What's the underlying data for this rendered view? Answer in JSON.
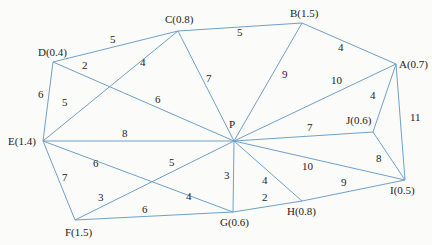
{
  "nodes": {
    "A": {
      "label": "A(0.7)",
      "x": 396,
      "y": 64,
      "lx": 399,
      "ly": 68
    },
    "B": {
      "label": "B(1.5)",
      "x": 302,
      "y": 23,
      "lx": 290,
      "ly": 17
    },
    "C": {
      "label": "C(0.8)",
      "x": 178,
      "y": 31,
      "lx": 165,
      "ly": 23
    },
    "D": {
      "label": "D(0.4)",
      "x": 53,
      "y": 62,
      "lx": 38,
      "ly": 56
    },
    "E": {
      "label": "E(1.4)",
      "x": 43,
      "y": 141,
      "lx": 8,
      "ly": 145
    },
    "F": {
      "label": "F(1.5)",
      "x": 75,
      "y": 220,
      "lx": 65,
      "ly": 236
    },
    "G": {
      "label": "G(0.6)",
      "x": 233,
      "y": 212,
      "lx": 220,
      "ly": 226
    },
    "H": {
      "label": "H(0.8)",
      "x": 302,
      "y": 201,
      "lx": 287,
      "ly": 215
    },
    "I": {
      "label": "I(0.5)",
      "x": 405,
      "y": 180,
      "lx": 390,
      "ly": 194
    },
    "J": {
      "label": "J(0.6)",
      "x": 373,
      "y": 132,
      "lx": 346,
      "ly": 124
    },
    "P": {
      "label": "P",
      "x": 234,
      "y": 141,
      "lx": 229,
      "ly": 128
    }
  },
  "edges": [
    {
      "from": "D",
      "to": "C",
      "weight": "5",
      "lx": 110,
      "ly": 43
    },
    {
      "from": "C",
      "to": "B",
      "weight": "5",
      "lx": 237,
      "ly": 36
    },
    {
      "from": "B",
      "to": "A",
      "weight": "4",
      "lx": 338,
      "ly": 51
    },
    {
      "from": "D",
      "to": "E",
      "weight": "6",
      "lx": 38,
      "ly": 98
    },
    {
      "from": "C",
      "to": "P",
      "weight": "7",
      "lx": 206,
      "ly": 82
    },
    {
      "from": "B",
      "to": "P",
      "weight": "9",
      "lx": 282,
      "ly": 78
    },
    {
      "from": "A",
      "to": "P",
      "weight": "10",
      "lx": 331,
      "ly": 84
    },
    {
      "from": "A",
      "to": "J",
      "weight": "4",
      "lx": 370,
      "ly": 99
    },
    {
      "from": "A",
      "to": "I",
      "weight": "11",
      "lx": 410,
      "ly": 121
    },
    {
      "from": "J",
      "to": "P",
      "weight": "7",
      "lx": 307,
      "ly": 131
    },
    {
      "from": "J",
      "to": "I",
      "weight": "8",
      "lx": 376,
      "ly": 162
    },
    {
      "from": "E",
      "to": "P",
      "weight": "8",
      "lx": 122,
      "ly": 137
    },
    {
      "from": "P",
      "to": "I",
      "weight": "10",
      "lx": 302,
      "ly": 170
    },
    {
      "from": "P",
      "to": "H",
      "weight": "4",
      "lx": 262,
      "ly": 184
    },
    {
      "from": "P",
      "to": "G",
      "weight": "3",
      "lx": 224,
      "ly": 179
    },
    {
      "from": "G",
      "to": "H",
      "weight": "2",
      "lx": 262,
      "ly": 201
    },
    {
      "from": "H",
      "to": "I",
      "weight": "9",
      "lx": 341,
      "ly": 186
    },
    {
      "from": "E",
      "to": "F",
      "weight": "7",
      "lx": 62,
      "ly": 181
    },
    {
      "from": "F",
      "to": "G",
      "weight": "6",
      "lx": 142,
      "ly": 213
    }
  ],
  "crossing_edges": [
    {
      "from": "C",
      "to": "E",
      "via": [
        97,
        81
      ],
      "weights": [
        {
          "w": "4",
          "lx": 140,
          "ly": 66
        },
        {
          "w": "5",
          "lx": 62,
          "ly": 106
        }
      ]
    },
    {
      "from": "D",
      "to": "P",
      "via": [
        97,
        81
      ],
      "weights": [
        {
          "w": "2",
          "lx": 82,
          "ly": 69
        },
        {
          "w": "6",
          "lx": 155,
          "ly": 103
        }
      ]
    },
    {
      "from": "E",
      "to": "G",
      "via": [
        133,
        190
      ],
      "weights": [
        {
          "w": "6",
          "lx": 93,
          "ly": 167
        },
        {
          "w": "4",
          "lx": 186,
          "ly": 200
        }
      ]
    },
    {
      "from": "F",
      "to": "P",
      "via": [
        133,
        190
      ],
      "weights": [
        {
          "w": "3",
          "lx": 98,
          "ly": 201
        },
        {
          "w": "5",
          "lx": 169,
          "ly": 166
        }
      ]
    }
  ]
}
